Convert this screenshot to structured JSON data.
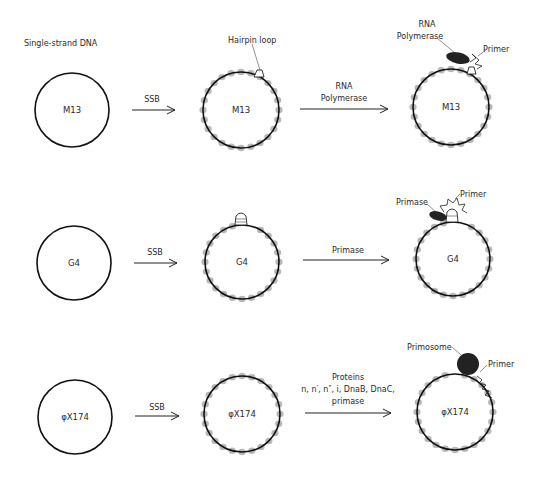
{
  "header": {
    "title": "Single-strand DNA"
  },
  "colors": {
    "ring": "#111111",
    "ssb": "#b8b8b8",
    "enzyme": "#222222",
    "background": "#ffffff"
  },
  "rows": [
    {
      "template": "M13",
      "step1_label": "SSB",
      "step1_annotation": "Hairpin loop",
      "step2_label_lines": [
        "RNA",
        "Polymerase"
      ],
      "final_annotations": {
        "enzyme_lines": [
          "RNA",
          "Polymerase"
        ],
        "primer": "Primer"
      }
    },
    {
      "template": "G4",
      "step1_label": "SSB",
      "step2_label_lines": [
        "Primase"
      ],
      "final_annotations": {
        "enzyme_lines": [
          "Primase"
        ],
        "primer": "Primer"
      }
    },
    {
      "template": "φX174",
      "step1_label": "SSB",
      "step2_label_lines": [
        "Proteins",
        "n, n′, n″, i, DnaB, DnaC,",
        "primase"
      ],
      "final_annotations": {
        "enzyme_lines": [
          "Primosome"
        ],
        "primer": "Primer"
      }
    }
  ]
}
